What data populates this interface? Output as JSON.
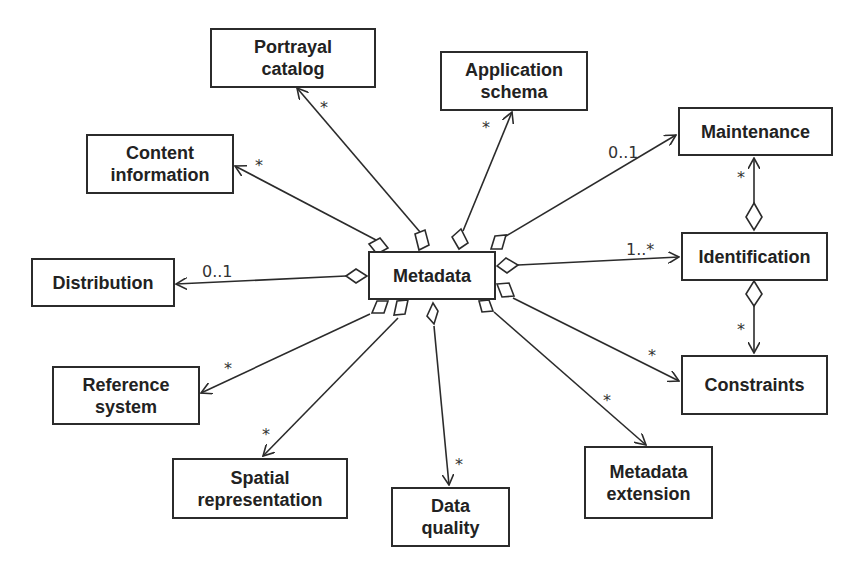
{
  "diagram": {
    "type": "UML aggregation diagram",
    "center": "Metadata",
    "classes": [
      {
        "id": "metadata",
        "label": "Metadata"
      },
      {
        "id": "portrayal",
        "label": "Portrayal\ncatalog"
      },
      {
        "id": "appschema",
        "label": "Application\nschema"
      },
      {
        "id": "content",
        "label": "Content\ninformation"
      },
      {
        "id": "maintenance",
        "label": "Maintenance"
      },
      {
        "id": "distribution",
        "label": "Distribution"
      },
      {
        "id": "identification",
        "label": "Identification"
      },
      {
        "id": "reference",
        "label": "Reference\nsystem"
      },
      {
        "id": "constraints",
        "label": "Constraints"
      },
      {
        "id": "spatial",
        "label": "Spatial\nrepresentation"
      },
      {
        "id": "dataquality",
        "label": "Data\nquality"
      },
      {
        "id": "extension",
        "label": "Metadata\nextension"
      }
    ],
    "associations": [
      {
        "from": "Metadata",
        "to": "Portrayal catalog",
        "multiplicity": "*"
      },
      {
        "from": "Metadata",
        "to": "Application schema",
        "multiplicity": "*"
      },
      {
        "from": "Metadata",
        "to": "Content information",
        "multiplicity": "*"
      },
      {
        "from": "Metadata",
        "to": "Maintenance",
        "multiplicity": "0..1"
      },
      {
        "from": "Metadata",
        "to": "Distribution",
        "multiplicity": "0..1"
      },
      {
        "from": "Metadata",
        "to": "Identification",
        "multiplicity": "1..*"
      },
      {
        "from": "Metadata",
        "to": "Reference system",
        "multiplicity": "*"
      },
      {
        "from": "Metadata",
        "to": "Constraints",
        "multiplicity": "*"
      },
      {
        "from": "Metadata",
        "to": "Spatial representation",
        "multiplicity": "*"
      },
      {
        "from": "Metadata",
        "to": "Data quality",
        "multiplicity": "*"
      },
      {
        "from": "Metadata",
        "to": "Metadata extension",
        "multiplicity": "*"
      },
      {
        "from": "Identification",
        "to": "Maintenance",
        "multiplicity": "*"
      },
      {
        "from": "Identification",
        "to": "Constraints",
        "multiplicity": "*"
      }
    ],
    "multiplicities": {
      "portrayal": "*",
      "appschema": "*",
      "content": "*",
      "maintenance": "0..1",
      "distribution": "0..1",
      "identification": "1..*",
      "reference": "*",
      "constraints": "*",
      "spatial": "*",
      "dataquality": "*",
      "extension": "*",
      "ident_maint": "*",
      "ident_constraints": "*"
    }
  }
}
